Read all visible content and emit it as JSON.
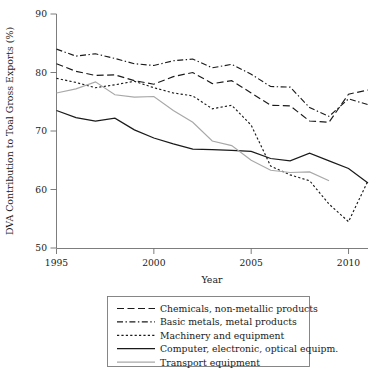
{
  "chart_data": {
    "type": "line",
    "title": "",
    "xlabel": "Year",
    "ylabel": "DVA Contribution to Toal Gross Exports (%)",
    "xlim": [
      1995,
      2011
    ],
    "ylim": [
      50,
      90
    ],
    "xticks": [
      1995,
      2000,
      2005,
      2010
    ],
    "yticks": [
      50,
      60,
      70,
      80,
      90
    ],
    "xticklabels": [
      "1995",
      "2000",
      "2005",
      "2010"
    ],
    "yticklabels": [
      "50",
      "60",
      "70",
      "80",
      "90"
    ],
    "grid": false,
    "legend_position": "below-axes",
    "x": [
      1995,
      1996,
      1997,
      1998,
      1999,
      2000,
      2001,
      2002,
      2003,
      2004,
      2005,
      2006,
      2007,
      2008,
      2009,
      2010,
      2011
    ],
    "series": [
      {
        "name": "Chemicals, non-metallic products",
        "style": "dashed",
        "color": "#1a1a1a",
        "values": [
          81.5,
          80.2,
          79.5,
          79.6,
          78.6,
          78.0,
          79.3,
          80.0,
          78.1,
          78.6,
          76.5,
          74.4,
          74.3,
          71.7,
          71.5,
          76.3,
          77.0
        ]
      },
      {
        "name": "Basic metals, metal products",
        "style": "dashdot",
        "color": "#1a1a1a",
        "values": [
          84.0,
          82.8,
          83.2,
          82.4,
          81.5,
          81.2,
          82.0,
          82.3,
          80.8,
          81.4,
          79.7,
          77.6,
          77.5,
          74.0,
          72.5,
          75.5,
          74.5
        ]
      },
      {
        "name": "Machinery and equipment",
        "style": "dotted",
        "color": "#1a1a1a",
        "values": [
          79.0,
          78.3,
          77.4,
          77.9,
          78.5,
          77.4,
          76.5,
          76.0,
          73.8,
          74.4,
          71.0,
          64.0,
          62.5,
          61.5,
          57.5,
          54.5,
          61.5
        ]
      },
      {
        "name": "Computer, electronic, optical equipm.",
        "style": "solid",
        "color": "#1a1a1a",
        "values": [
          73.5,
          72.3,
          71.7,
          72.2,
          70.2,
          68.8,
          67.8,
          66.9,
          66.8,
          66.7,
          66.5,
          65.3,
          64.9,
          66.2,
          64.9,
          63.6,
          61.1
        ]
      },
      {
        "name": "Transport equipment",
        "style": "solid-gray",
        "color": "#a8a8a8",
        "values": [
          76.5,
          77.2,
          78.4,
          76.2,
          75.8,
          75.9,
          73.5,
          71.5,
          68.3,
          67.5,
          65.0,
          63.3,
          62.9,
          63.0,
          61.5,
          null,
          null
        ]
      }
    ]
  },
  "legend": {
    "items": [
      {
        "label": "Chemicals, non-metallic products",
        "swatch": "dashed-line-swatch"
      },
      {
        "label": "Basic metals, metal products",
        "swatch": "dashdot-line-swatch"
      },
      {
        "label": "Machinery and equipment",
        "swatch": "dotted-line-swatch"
      },
      {
        "label": "Computer, electronic, optical equipm.",
        "swatch": "solid-line-swatch"
      },
      {
        "label": "Transport equipment",
        "swatch": "gray-line-swatch"
      }
    ]
  }
}
